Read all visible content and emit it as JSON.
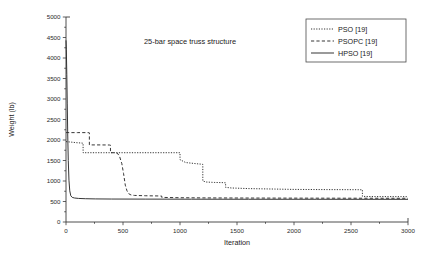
{
  "chart_data": {
    "type": "line",
    "title": "",
    "annotation": "25-bar space truss structure",
    "xlabel": "Iteration",
    "ylabel": "Weight (lb)",
    "xlim": [
      0,
      3000
    ],
    "ylim": [
      0,
      5000
    ],
    "xticks": [
      0,
      500,
      1000,
      1500,
      2000,
      2500,
      3000
    ],
    "yticks": [
      0,
      500,
      1000,
      1500,
      2000,
      2500,
      3000,
      3500,
      4000,
      4500,
      5000
    ],
    "grid": false,
    "legend_position": "top-right",
    "series": [
      {
        "name": "PSO [19]",
        "style": "dotted",
        "color": "#2b2b2b",
        "x": [
          0,
          40,
          90,
          140,
          150,
          150,
          330,
          600,
          1000,
          1000,
          1050,
          1150,
          1190,
          1200,
          1200,
          1230,
          1300,
          1380,
          1400,
          1400,
          1450,
          1600,
          1800,
          2000,
          2300,
          2560,
          2600,
          2600,
          2700,
          3000
        ],
        "y": [
          1960,
          1950,
          1935,
          1925,
          1920,
          1690,
          1690,
          1690,
          1690,
          1520,
          1450,
          1420,
          1410,
          1405,
          1000,
          975,
          965,
          960,
          955,
          845,
          830,
          815,
          805,
          795,
          790,
          788,
          785,
          625,
          620,
          618
        ]
      },
      {
        "name": "PSOPC [19]",
        "style": "dashed",
        "color": "#2b2b2b",
        "x": [
          0,
          100,
          200,
          205,
          205,
          300,
          380,
          390,
          390,
          420,
          450,
          470,
          490,
          505,
          520,
          535,
          550,
          570,
          600,
          700,
          820,
          840,
          840,
          900,
          1000,
          1100,
          1200,
          1500,
          2000,
          2500,
          3000
        ],
        "y": [
          2180,
          2180,
          2180,
          2175,
          1880,
          1880,
          1878,
          1875,
          1690,
          1690,
          1680,
          1600,
          1420,
          1180,
          900,
          760,
          690,
          660,
          648,
          640,
          635,
          632,
          600,
          597,
          592,
          590,
          588,
          585,
          582,
          580,
          578
        ]
      },
      {
        "name": "HPSO [19]",
        "style": "solid",
        "color": "#2b2b2b",
        "x": [
          0,
          3,
          7,
          11,
          15,
          20,
          26,
          33,
          42,
          55,
          75,
          110,
          170,
          260,
          400,
          700,
          1100,
          1600,
          2200,
          3000
        ],
        "y": [
          4430,
          4200,
          3600,
          2900,
          2150,
          1500,
          1020,
          760,
          640,
          600,
          585,
          575,
          568,
          563,
          560,
          558,
          556,
          555,
          554,
          553
        ]
      }
    ]
  }
}
